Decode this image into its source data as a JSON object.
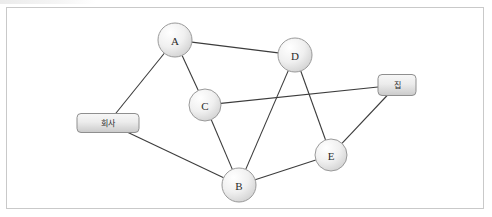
{
  "diagram": {
    "title": "",
    "background_color": "#ffffff",
    "frame": {
      "border_color": "#c9c9c9",
      "x": 6,
      "y": 7,
      "width": 478,
      "height": 202
    },
    "node_style": {
      "fill_top": "#ffffff",
      "fill_bottom": "#d8d8d8",
      "stroke": "#9a9a9a",
      "radius": 17
    },
    "box_style": {
      "fill_top": "#f4f4f4",
      "fill_bottom": "#cfcfcf",
      "stroke": "#8f8f8f",
      "corner_radius": 4
    },
    "edge_style": {
      "stroke": "#3c3c3c",
      "width": 1.1
    },
    "nodes": [
      {
        "id": "A",
        "label": "A",
        "shape": "circle",
        "x": 175,
        "y": 40,
        "r": 17
      },
      {
        "id": "D",
        "label": "D",
        "shape": "circle",
        "x": 295,
        "y": 55,
        "r": 17
      },
      {
        "id": "C",
        "label": "C",
        "shape": "circle",
        "x": 205,
        "y": 105,
        "r": 16
      },
      {
        "id": "E",
        "label": "E",
        "shape": "circle",
        "x": 331,
        "y": 155,
        "r": 16
      },
      {
        "id": "B",
        "label": "B",
        "shape": "circle",
        "x": 239,
        "y": 185,
        "r": 17
      },
      {
        "id": "company",
        "label": "회사",
        "shape": "box",
        "x": 108,
        "y": 123,
        "width": 62,
        "height": 19
      },
      {
        "id": "home",
        "label": "집",
        "shape": "box",
        "x": 397,
        "y": 85,
        "width": 38,
        "height": 21
      }
    ],
    "edges": [
      {
        "from": "A",
        "to": "company"
      },
      {
        "from": "A",
        "to": "C"
      },
      {
        "from": "A",
        "to": "D"
      },
      {
        "from": "C",
        "to": "home"
      },
      {
        "from": "C",
        "to": "B"
      },
      {
        "from": "D",
        "to": "B"
      },
      {
        "from": "D",
        "to": "E"
      },
      {
        "from": "E",
        "to": "home"
      },
      {
        "from": "E",
        "to": "B"
      },
      {
        "from": "B",
        "to": "company"
      }
    ]
  }
}
